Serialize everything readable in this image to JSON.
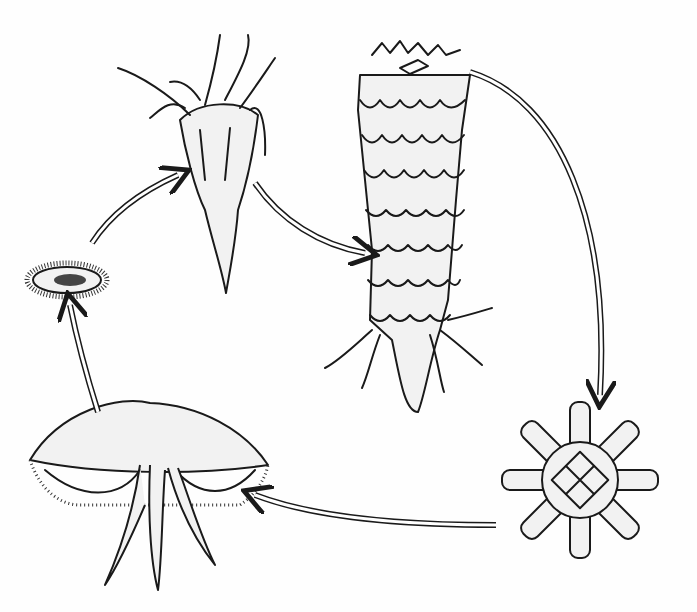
{
  "diagram": {
    "title": "",
    "type": "life-cycle",
    "stages": [
      {
        "id": "planula",
        "label": ""
      },
      {
        "id": "polyp",
        "label": ""
      },
      {
        "id": "strobila",
        "label": ""
      },
      {
        "id": "ephyra",
        "label": ""
      },
      {
        "id": "medusa",
        "label": ""
      }
    ],
    "arrows": [
      {
        "from": "planula",
        "to": "polyp"
      },
      {
        "from": "polyp",
        "to": "strobila"
      },
      {
        "from": "strobila",
        "to": "ephyra"
      },
      {
        "from": "ephyra",
        "to": "medusa"
      },
      {
        "from": "medusa",
        "to": "planula"
      }
    ],
    "colors": {
      "ink": "#1a1a1a",
      "background": "#fefefe",
      "stipple": "#f2f2f2"
    }
  }
}
